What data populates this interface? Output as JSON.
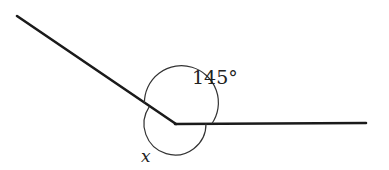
{
  "diagram": {
    "type": "angle-at-a-point",
    "vertex": {
      "x": 175,
      "y": 123
    },
    "rays": [
      {
        "name": "left-ray",
        "from": {
          "x": 175,
          "y": 123
        },
        "to": {
          "x": 17,
          "y": 16
        }
      },
      {
        "name": "right-ray",
        "from": {
          "x": 175,
          "y": 123
        },
        "to": {
          "x": 366,
          "y": 123
        }
      }
    ],
    "angles": [
      {
        "name": "known-angle",
        "label": "145°",
        "value_degrees": 145,
        "position": "upper"
      },
      {
        "name": "unknown-angle",
        "label": "x",
        "position": "lower-reflex"
      }
    ],
    "colors": {
      "line": "#1a1a1a",
      "arc": "#333333",
      "text": "#222222"
    }
  }
}
